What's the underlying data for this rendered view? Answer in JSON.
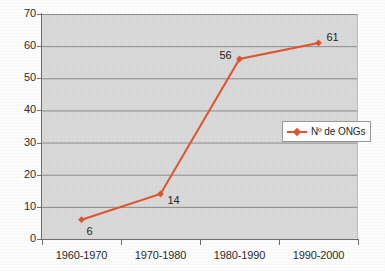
{
  "chart_data": {
    "type": "line",
    "title": "",
    "subtitle": "",
    "xlabel": "",
    "ylabel": "",
    "categories": [
      "1960-1970",
      "1970-1980",
      "1980-1990",
      "1990-2000"
    ],
    "series": [
      {
        "name": "Nº de ONGs",
        "values": [
          6,
          14,
          56,
          61
        ],
        "color": "#e0552d",
        "marker": "diamond"
      }
    ],
    "point_labels": [
      "6",
      "14",
      "56",
      "61"
    ],
    "ylim": [
      0,
      70
    ],
    "y_ticks": [
      "0",
      "10",
      "20",
      "30",
      "40",
      "50",
      "60",
      "70"
    ],
    "grid": "horizontal",
    "legend_position": "center-right",
    "plot_background": "#d9d9d9",
    "gridline_color": "#8c8c8c",
    "axis_color": "#6e6e6e"
  },
  "legend": {
    "entries": [
      {
        "label": "Nº de ONGs",
        "symbol": "line-with-diamond-marker"
      }
    ]
  }
}
